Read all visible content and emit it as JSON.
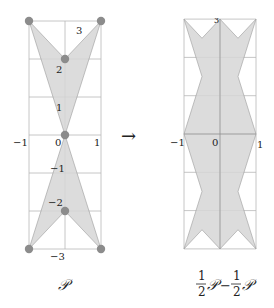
{
  "left_figure": {
    "caption": "𝒫",
    "x_ticks": [
      {
        "value": -1,
        "label": "−1"
      },
      {
        "value": 0,
        "label": "0"
      },
      {
        "value": 1,
        "label": "1"
      }
    ],
    "y_ticks": [
      {
        "value": 3,
        "label": "3"
      },
      {
        "value": 2,
        "label": "2"
      },
      {
        "value": 1,
        "label": "1"
      },
      {
        "value": -1,
        "label": "−1"
      },
      {
        "value": -2,
        "label": "−2"
      },
      {
        "value": -3,
        "label": "−3"
      }
    ],
    "polygon_upper": [
      [
        -1,
        3
      ],
      [
        0,
        2
      ],
      [
        1,
        3
      ],
      [
        0,
        0
      ]
    ],
    "polygon_lower": [
      [
        0,
        0
      ],
      [
        1,
        -3
      ],
      [
        0,
        -2
      ],
      [
        -1,
        -3
      ]
    ],
    "vertices": [
      [
        -1,
        3
      ],
      [
        1,
        3
      ],
      [
        0,
        2
      ],
      [
        0,
        0
      ],
      [
        0,
        -2
      ],
      [
        -1,
        -3
      ],
      [
        1,
        -3
      ]
    ]
  },
  "arrow": {
    "glyph": "→"
  },
  "right_figure": {
    "caption_frac_num": "1",
    "caption_frac_den": "2",
    "caption_P": "𝒫",
    "caption_minus": "−",
    "x_ticks": [
      {
        "value": -1,
        "label": "−1"
      },
      {
        "value": 0,
        "label": "0"
      },
      {
        "value": 1,
        "label": "1"
      }
    ],
    "top_label": "3",
    "polygon": [
      [
        -1,
        3
      ],
      [
        -0.5,
        2.5
      ],
      [
        0,
        3
      ],
      [
        0.5,
        2.5
      ],
      [
        1,
        3
      ],
      [
        0.5,
        1.5
      ],
      [
        1,
        0
      ],
      [
        0.5,
        -1.5
      ],
      [
        1,
        -3
      ],
      [
        0.5,
        -2.5
      ],
      [
        0,
        -3
      ],
      [
        -0.5,
        -2.5
      ],
      [
        -1,
        -3
      ],
      [
        -0.5,
        -1.5
      ],
      [
        -1,
        0
      ],
      [
        -0.5,
        1.5
      ]
    ]
  },
  "colors": {
    "fill": "#d6d6d6",
    "stroke": "#9a9a9a",
    "grid": "#b8b8b8",
    "vertex": "#8c8c8c"
  }
}
